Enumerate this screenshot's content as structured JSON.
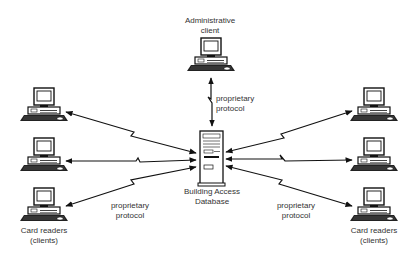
{
  "diagram": {
    "type": "network-architecture",
    "admin_client": {
      "label_line1": "Administrative",
      "label_line2": "client",
      "icon": "desktop-computer-icon"
    },
    "server": {
      "label_line1": "Building Access",
      "label_line2": "Database",
      "icon": "server-tower-icon"
    },
    "left_group": {
      "label_line1": "Card readers",
      "label_line2": "(clients)",
      "count": 3,
      "icon": "desktop-computer-icon"
    },
    "right_group": {
      "label_line1": "Card readers",
      "label_line2": "(clients)",
      "count": 3,
      "icon": "desktop-computer-icon"
    },
    "protocol_labels": {
      "top": {
        "line1": "proprietary",
        "line2": "protocol"
      },
      "left": {
        "line1": "proprietary",
        "line2": "protocol"
      },
      "right": {
        "line1": "proprietary",
        "line2": "protocol"
      }
    },
    "connections": [
      {
        "from": "Administrative client",
        "to": "Building Access Database",
        "style": "bidirectional-lightning"
      },
      {
        "from": "Card reader L1",
        "to": "Building Access Database",
        "style": "bidirectional-lightning"
      },
      {
        "from": "Card reader L2",
        "to": "Building Access Database",
        "style": "bidirectional-lightning"
      },
      {
        "from": "Card reader L3",
        "to": "Building Access Database",
        "style": "bidirectional-lightning"
      },
      {
        "from": "Card reader R1",
        "to": "Building Access Database",
        "style": "bidirectional-lightning"
      },
      {
        "from": "Card reader R2",
        "to": "Building Access Database",
        "style": "bidirectional-lightning"
      },
      {
        "from": "Card reader R3",
        "to": "Building Access Database",
        "style": "bidirectional-lightning"
      }
    ]
  }
}
